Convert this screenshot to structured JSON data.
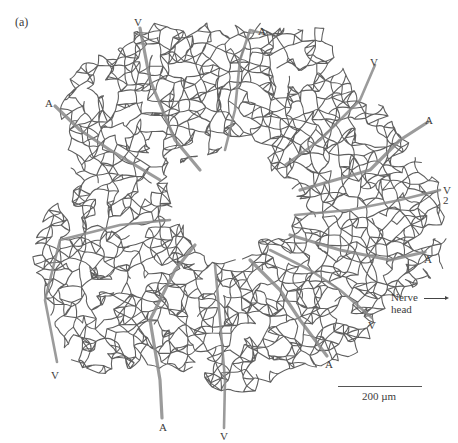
{
  "figure": {
    "panel_label": "(a)",
    "colors": {
      "capillary": "#5f5f5f",
      "vessel_major": "#8a8a8a",
      "background": "#ffffff"
    },
    "vessel_labels": [
      {
        "text": "V",
        "x": 134,
        "y": 17
      },
      {
        "text": "A",
        "x": 258,
        "y": 26
      },
      {
        "text": "A",
        "x": 45,
        "y": 98
      },
      {
        "text": "V",
        "x": 370,
        "y": 57
      },
      {
        "text": "A",
        "x": 425,
        "y": 115
      },
      {
        "text": "V",
        "x": 443,
        "y": 185
      },
      {
        "text": "2",
        "x": 443,
        "y": 195
      },
      {
        "text": "A",
        "x": 424,
        "y": 254
      },
      {
        "text": "V",
        "x": 368,
        "y": 320
      },
      {
        "text": "A",
        "x": 325,
        "y": 359
      },
      {
        "text": "V",
        "x": 51,
        "y": 370
      },
      {
        "text": "A",
        "x": 159,
        "y": 422
      },
      {
        "text": "V",
        "x": 220,
        "y": 431
      }
    ],
    "annotation": {
      "line1": "Nerve",
      "line2": "head",
      "direction": "right-arrow"
    },
    "scale_bar": {
      "label": "200 µm"
    }
  }
}
